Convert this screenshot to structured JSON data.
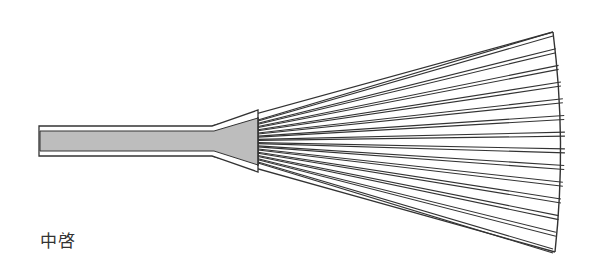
{
  "diagram": {
    "caption": "中啓",
    "colors": {
      "outline": "#333333",
      "handle_fill": "#bdbdbd",
      "background": "#ffffff"
    },
    "rib_count": 14
  }
}
